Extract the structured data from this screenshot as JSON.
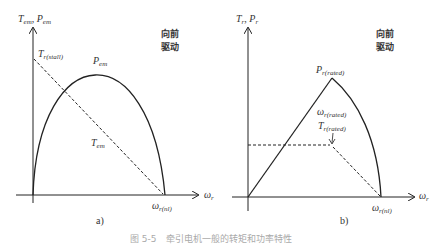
{
  "figure": {
    "caption": "图 5-5　牵引电机一般的转矩和功率特性",
    "panels": [
      {
        "id": "a",
        "sub_caption": "a)",
        "y_axis_label_main_1": "T",
        "y_axis_label_sub_1": "em",
        "y_axis_label_sep": ", ",
        "y_axis_label_main_2": "P",
        "y_axis_label_sub_2": "em",
        "x_axis_label_main": "ω",
        "x_axis_label_sub": "r",
        "region_label_line1": "向前",
        "region_label_line2": "驱动",
        "stall_label_main": "T",
        "stall_label_sub": "r(stall)",
        "power_curve_label_main": "P",
        "power_curve_label_sub": "em",
        "torque_curve_label_main": "T",
        "torque_curve_label_sub": "em",
        "no_load_speed_main": "ω",
        "no_load_speed_sub": "r(nl)"
      },
      {
        "id": "b",
        "sub_caption": "b)",
        "y_axis_label_main_1": "T",
        "y_axis_label_sub_1": "r",
        "y_axis_label_sep": ", ",
        "y_axis_label_main_2": "P",
        "y_axis_label_sub_2": "r",
        "x_axis_label_main": "ω",
        "x_axis_label_sub": "r",
        "region_label_line1": "向前",
        "region_label_line2": "驱动",
        "rated_power_main": "P",
        "rated_power_sub": "r(rated)",
        "rated_speed_main": "ω",
        "rated_speed_sub": "r(rated)",
        "rated_torque_main": "T",
        "rated_torque_sub": "r(rated)",
        "no_load_speed_main": "ω",
        "no_load_speed_sub": "r(nl)"
      }
    ]
  },
  "colors": {
    "line": "#222222",
    "text": "#333333",
    "caption": "#aaaaaa"
  }
}
